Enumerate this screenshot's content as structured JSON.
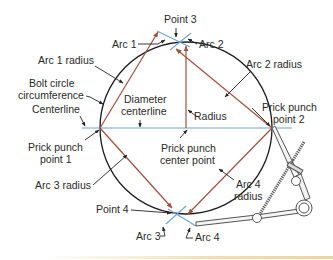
{
  "figure": {
    "type": "bolt-circle-layout",
    "colors": {
      "circle": "#1a1a1a",
      "centerline": "#6fa3cf",
      "radius_lines": "#a0513e",
      "arc_marks": "#6fa3cf",
      "leaders": "#222222",
      "compass": "#555555"
    },
    "labels": {
      "point3": "Point 3",
      "arc1": "Arc 1",
      "arc2": "Arc 2",
      "arc1_radius": "Arc 1 radius",
      "arc2_radius": "Arc 2 radius",
      "bolt_circle_line1": "Bolt circle",
      "bolt_circle_line2": "circumference",
      "centerline": "Centerline",
      "diameter_centerline_line1": "Diameter",
      "diameter_centerline_line2": "centerline",
      "radius": "Radius",
      "prick_punch_point2_line1": "Prick punch",
      "prick_punch_point2_line2": "point 2",
      "prick_punch_point1_line1": "Prick punch",
      "prick_punch_point1_line2": "point 1",
      "prick_punch_center_line1": "Prick punch",
      "prick_punch_center_line2": "center point",
      "arc3_radius": "Arc 3 radius",
      "arc4_radius_line1": "Arc 4",
      "arc4_radius_line2": "radius",
      "point4": "Point 4",
      "arc3": "Arc 3",
      "arc4": "Arc 4"
    }
  }
}
